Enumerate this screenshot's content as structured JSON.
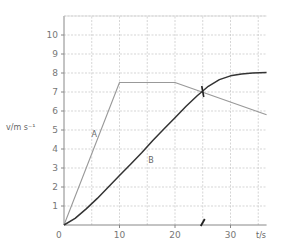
{
  "chart_data": {
    "type": "line",
    "title": "",
    "xlabel": "t/s",
    "ylabel": "v/m s⁻¹",
    "xlim": [
      0,
      36.5
    ],
    "ylim": [
      0,
      11
    ],
    "grid": true,
    "grid_minor_x": 5,
    "grid_minor_y": 1,
    "x_ticks": [
      0,
      10,
      20,
      30
    ],
    "y_ticks": [
      1,
      2,
      3,
      4,
      5,
      6,
      7,
      8,
      9,
      10
    ],
    "series": [
      {
        "name": "A",
        "color": "#999999",
        "x": [
          0,
          10,
          20,
          36.5
        ],
        "y": [
          0,
          7.5,
          7.5,
          5.8
        ]
      },
      {
        "name": "B",
        "color": "#333333",
        "x": [
          0,
          2,
          4,
          6,
          8,
          10,
          12,
          14,
          16,
          18,
          20,
          22,
          24,
          25,
          26,
          28,
          30,
          32,
          34,
          36.5
        ],
        "y": [
          0,
          0.35,
          0.85,
          1.4,
          2.0,
          2.6,
          3.2,
          3.8,
          4.45,
          5.05,
          5.65,
          6.25,
          6.8,
          7.05,
          7.3,
          7.65,
          7.85,
          7.95,
          8.0,
          8.02
        ]
      }
    ],
    "annotations": [
      {
        "text": "A",
        "x": 5.5,
        "y": 4.8
      },
      {
        "text": "B",
        "x": 15,
        "y": 3.4
      },
      {
        "text": "intersection-marker",
        "x": 25,
        "y": 7.0
      },
      {
        "text": "t-axis-marker",
        "x": 25,
        "y": 0
      }
    ]
  },
  "labels": {
    "origin": "0",
    "x_axis": "t/s",
    "y_axis": "v/m s⁻¹",
    "series_a": "A",
    "series_b": "B"
  }
}
